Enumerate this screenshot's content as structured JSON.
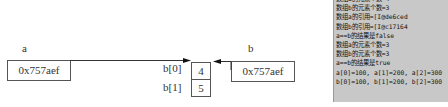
{
  "diagram": {
    "variables": [
      {
        "name": "a",
        "value": "0x757aef"
      },
      {
        "name": "b",
        "value": "0x757aef"
      }
    ],
    "array": {
      "indices": [
        "b[0]",
        "b[1]"
      ],
      "values": [
        "4",
        "5"
      ]
    }
  },
  "console": {
    "lines": [
      "数组a的元素个数=4",
      "数组b的元素个数=3",
      "数组a的引用=[I@de6ced",
      "数组b的引用=[I@c17164",
      "a==b的结果是false",
      "数组a的元素个数=3",
      "数组b的元素个数=3",
      "a==b的结果是true",
      "a[0]=100, a[1]=200, a[2]=300",
      "b[0]=100, b[1]=200, b[2]=300"
    ],
    "background": "#c8c8c8"
  }
}
